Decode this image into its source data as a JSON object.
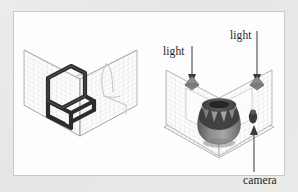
{
  "figure": {
    "background_color": "#e8e8e6",
    "panel_color": "#fdfdfd",
    "panel_border_color": "#c9c9c7",
    "ink_color": "#1d1d1d",
    "grid_color": "#bfbfbf",
    "edge_color": "#8a8a8a",
    "ghost_color": "#c2c2c2"
  },
  "left_panel": {
    "name": "chair-in-gridded-room",
    "object": "chair",
    "object_color": "#2a2a2a",
    "room_type": "closed-cube",
    "surfaces": [
      "floor",
      "left-wall",
      "right-wall"
    ],
    "grid": "fine-quad-mesh",
    "ghost_outline": "chair-silhouette-on-right-wall"
  },
  "right_panel": {
    "name": "vase-in-open-corner-room",
    "object": "vase",
    "object_color": "#6e6e6e",
    "object_detail_color": "#3a3a3a",
    "room_type": "open-corner",
    "surfaces": [
      "floor",
      "left-wall",
      "right-wall"
    ],
    "grid": "fine-quad-mesh",
    "annotations": [
      {
        "id": "light-left",
        "label": "light",
        "marker": "light-cone",
        "arrow": "down"
      },
      {
        "id": "light-right",
        "label": "light",
        "marker": "light-cone",
        "arrow": "down"
      },
      {
        "id": "camera",
        "label": "camera",
        "marker": "camera-body",
        "arrow": "up"
      }
    ]
  },
  "labels": {
    "light_left": "light",
    "light_right": "light",
    "camera": "camera"
  }
}
